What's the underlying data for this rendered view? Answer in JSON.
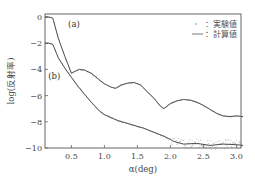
{
  "chart_data": {
    "type": "line",
    "title": "",
    "xlabel": "α(deg)",
    "ylabel": "log(反射率)",
    "xlim": [
      0.1,
      3.1
    ],
    "ylim": [
      -10,
      0.2
    ],
    "xticks": [
      0.5,
      1.0,
      1.5,
      2.0,
      2.5,
      3.0
    ],
    "xtick_labels": [
      "0.5",
      "1.0",
      "1.5",
      "2.0",
      "2.5",
      "3.0"
    ],
    "yticks": [
      0,
      -2,
      -4,
      -6,
      -8,
      -10
    ],
    "ytick_labels": [
      "0",
      "-2",
      "-4",
      "-6",
      "-8",
      "-10"
    ],
    "grid": false,
    "legend": {
      "position": "upper right",
      "entries": [
        {
          "marker": "dots",
          "label": "：実験値"
        },
        {
          "marker": "line",
          "label": "：計算値"
        }
      ]
    },
    "annotations": [
      {
        "text": "(a)",
        "x": 0.45,
        "y": -0.8
      },
      {
        "text": "(b)",
        "x": 0.15,
        "y": -4.7
      }
    ],
    "series": [
      {
        "name": "(a)",
        "x": [
          0.1,
          0.15,
          0.2,
          0.22,
          0.3,
          0.4,
          0.5,
          0.55,
          0.62,
          0.7,
          0.8,
          0.9,
          1.0,
          1.1,
          1.17,
          1.25,
          1.35,
          1.45,
          1.55,
          1.65,
          1.75,
          1.85,
          1.9,
          2.0,
          2.1,
          2.2,
          2.3,
          2.4,
          2.5,
          2.6,
          2.7,
          2.8,
          2.9,
          3.0,
          3.1
        ],
        "values": [
          0,
          0,
          -0.05,
          -0.1,
          -1.6,
          -3.0,
          -4.3,
          -4.15,
          -4.0,
          -4.05,
          -4.3,
          -4.7,
          -5.1,
          -5.35,
          -5.45,
          -5.2,
          -5.05,
          -5.0,
          -5.2,
          -5.7,
          -6.2,
          -6.8,
          -7.0,
          -6.6,
          -6.4,
          -6.3,
          -6.35,
          -6.5,
          -6.75,
          -7.05,
          -7.35,
          -7.55,
          -7.6,
          -7.55,
          -7.6
        ]
      },
      {
        "name": "(b)",
        "x": [
          0.1,
          0.15,
          0.2,
          0.22,
          0.3,
          0.4,
          0.5,
          0.6,
          0.7,
          0.8,
          0.93,
          1.0,
          1.2,
          1.4,
          1.6,
          1.8,
          1.9,
          2.0,
          2.05,
          2.2,
          2.4,
          2.6,
          2.8,
          3.0,
          3.1
        ],
        "values": [
          -2.0,
          -2.0,
          -2.05,
          -2.1,
          -3.1,
          -3.9,
          -4.6,
          -5.3,
          -5.9,
          -6.5,
          -7.2,
          -7.45,
          -7.9,
          -8.2,
          -8.5,
          -8.9,
          -9.1,
          -9.35,
          -9.5,
          -9.7,
          -9.65,
          -9.8,
          -9.7,
          -9.75,
          -9.8
        ]
      }
    ]
  }
}
